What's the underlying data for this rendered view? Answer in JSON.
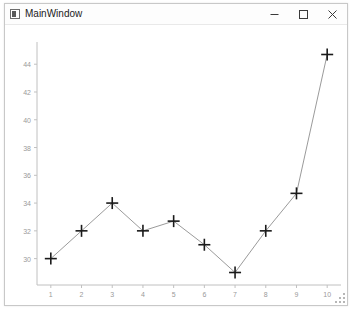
{
  "window": {
    "title": "MainWindow",
    "icon": "window-icon",
    "controls": [
      {
        "name": "minimize",
        "glyph": "minimize-icon"
      },
      {
        "name": "maximize",
        "glyph": "maximize-icon"
      },
      {
        "name": "close",
        "glyph": "close-icon"
      }
    ],
    "resize_grip": "resize-grip-icon",
    "border_color": "#c8c8c8",
    "background": "#ffffff"
  },
  "chart_data": {
    "type": "line",
    "title": "",
    "xlabel": "",
    "ylabel": "",
    "x": [
      1,
      2,
      3,
      4,
      5,
      6,
      7,
      8,
      9,
      10
    ],
    "values": [
      30,
      32,
      34,
      32,
      32.7,
      31,
      29,
      32,
      34.7,
      44.7
    ],
    "series": [
      {
        "name": "series-1",
        "values": [
          30,
          32,
          34,
          32,
          32.7,
          31,
          29,
          32,
          34.7,
          44.7
        ]
      }
    ],
    "xticks": [
      "1",
      "2",
      "3",
      "4",
      "5",
      "6",
      "7",
      "8",
      "9",
      "10"
    ],
    "yticks": [
      "30",
      "32",
      "34",
      "36",
      "38",
      "40",
      "42",
      "44"
    ],
    "ytick_values": [
      30,
      32,
      34,
      36,
      38,
      40,
      42,
      44
    ],
    "xlim": [
      0.55,
      10.45
    ],
    "ylim": [
      28.1,
      45.6
    ],
    "grid": false,
    "legend": "none",
    "marker": "plus",
    "line_color": "#808080",
    "marker_color": "#1a1a1a",
    "axis_color": "#c0c0c0",
    "tick_label_color": "#9a9a9a"
  }
}
